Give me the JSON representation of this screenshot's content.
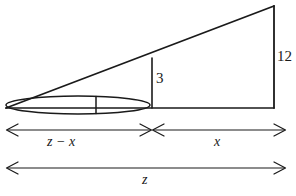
{
  "figure": {
    "kind": "geometry-diagram",
    "background_color": "#ffffff",
    "stroke_color": "#1a1a1a",
    "labels": {
      "lamppost_height": "12",
      "pole_height": "3",
      "left_segment": "z − x",
      "right_segment": "x",
      "total_length": "z"
    },
    "geometry": {
      "apex": [
        6,
        108
      ],
      "top_right": [
        274,
        6
      ],
      "bottom_right": [
        274,
        108
      ],
      "inner_vertical_x": 152,
      "inner_vertical_top_y": 58,
      "baseline_y": 108,
      "boat": {
        "left_x": 6,
        "right_x": 150,
        "center_y": 105,
        "half_height": 9,
        "mast_x": 96
      },
      "dim_line_upper_y": 130,
      "dim_line_lower_y": 168,
      "dim_split_x": 152,
      "dim_left_x": 6,
      "dim_right_x": 285
    }
  }
}
